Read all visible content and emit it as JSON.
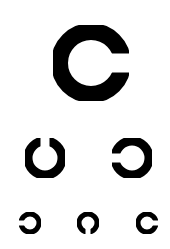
{
  "colors": {
    "background": "#ffffff",
    "ring": "#000000"
  },
  "rings": [
    {
      "id": "row1-ring1",
      "cx": 91,
      "cy": 63,
      "r": 40,
      "stroke": 17,
      "gap_direction": "right",
      "gap_size": 19
    },
    {
      "id": "row2-ring1",
      "cx": 45,
      "cy": 158,
      "r": 21.5,
      "stroke": 9,
      "gap_direction": "up",
      "gap_size": 9
    },
    {
      "id": "row2-ring2",
      "cx": 132,
      "cy": 158,
      "r": 21.5,
      "stroke": 9,
      "gap_direction": "left",
      "gap_size": 9
    },
    {
      "id": "row3-ring1",
      "cx": 30,
      "cy": 223,
      "r": 11.5,
      "stroke": 5,
      "gap_direction": "left",
      "gap_size": 5
    },
    {
      "id": "row3-ring2",
      "cx": 88,
      "cy": 223,
      "r": 11.5,
      "stroke": 5,
      "gap_direction": "down",
      "gap_size": 5
    },
    {
      "id": "row3-ring3",
      "cx": 147,
      "cy": 223,
      "r": 11.5,
      "stroke": 5,
      "gap_direction": "right",
      "gap_size": 5
    }
  ]
}
